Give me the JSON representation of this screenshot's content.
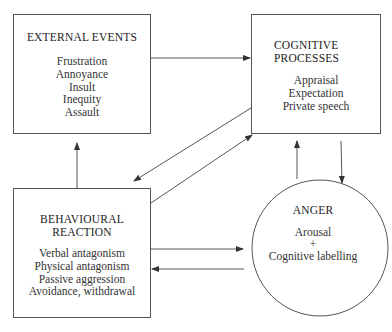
{
  "diagram": {
    "nodes": {
      "external_events": {
        "title": "EXTERNAL EVENTS",
        "items": [
          "Frustration",
          "Annoyance",
          "Insult",
          "Inequity",
          "Assault"
        ]
      },
      "cognitive_processes": {
        "title_line1": "COGNITIVE",
        "title_line2": "PROCESSES",
        "items": [
          "Appraisal",
          "Expectation",
          "Private speech"
        ]
      },
      "behavioural_reaction": {
        "title_line1": "BEHAVIOURAL",
        "title_line2": "REACTION",
        "items": [
          "Verbal antagonism",
          "Physical antagonism",
          "Passive aggression",
          "Avoidance, withdrawal"
        ]
      },
      "anger": {
        "title": "ANGER",
        "items": [
          "Arousal",
          "+",
          "Cognitive labelling"
        ]
      }
    },
    "edges": [
      {
        "from": "External Events",
        "to": "Cognitive Processes"
      },
      {
        "from": "Behavioural Reaction",
        "to": "External Events"
      },
      {
        "from": "Cognitive Processes",
        "to": "Behavioural Reaction"
      },
      {
        "from": "Behavioural Reaction",
        "to": "Cognitive Processes"
      },
      {
        "from": "Anger",
        "to": "Cognitive Processes"
      },
      {
        "from": "Cognitive Processes",
        "to": "Anger"
      },
      {
        "from": "Behavioural Reaction",
        "to": "Anger"
      },
      {
        "from": "Anger",
        "to": "Behavioural Reaction"
      }
    ],
    "colors": {
      "line": "#555555",
      "text": "#2a2a2a",
      "background": "#ffffff"
    }
  }
}
